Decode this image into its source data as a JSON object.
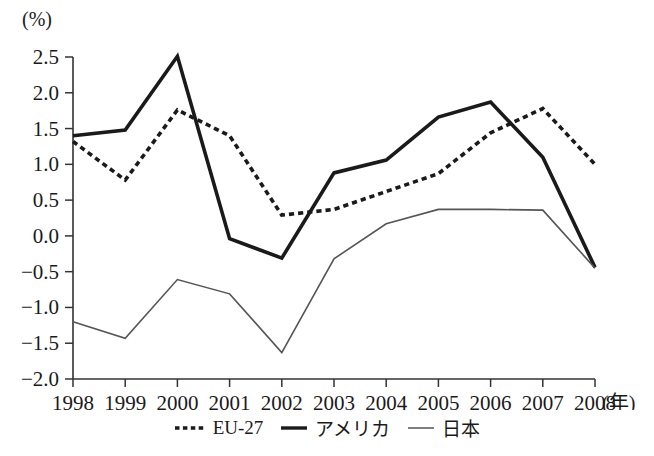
{
  "chart_data": {
    "type": "line",
    "title": "",
    "subtitle": "",
    "unit_label": "(%)",
    "xlabel": "(年)",
    "ylabel": "",
    "x": [
      1998,
      1999,
      2000,
      2001,
      2002,
      2003,
      2004,
      2005,
      2006,
      2007,
      2008
    ],
    "categories": [
      "1998",
      "1999",
      "2000",
      "2001",
      "2002",
      "2003",
      "2004",
      "2005",
      "2006",
      "2007",
      "2008"
    ],
    "xlim": [
      1998,
      2008
    ],
    "ylim": [
      -2.0,
      2.5
    ],
    "ytick_labels": [
      "2.5",
      "2.0",
      "1.5",
      "1.0",
      "0.5",
      "0.0",
      "−0.5",
      "−1.0",
      "−1.5",
      "−2.0"
    ],
    "ytick_values": [
      2.5,
      2.0,
      1.5,
      1.0,
      0.5,
      0.0,
      -0.5,
      -1.0,
      -1.5,
      -2.0
    ],
    "grid": false,
    "legend_position": "bottom",
    "series": [
      {
        "name": "EU-27",
        "style": "dotted",
        "color": "#1a1a1a",
        "values": [
          1.32,
          0.78,
          1.76,
          1.4,
          0.29,
          0.37,
          0.62,
          0.87,
          1.44,
          1.78,
          1.0
        ]
      },
      {
        "name": "アメリカ",
        "style": "thick-solid",
        "color": "#1a1a1a",
        "values": [
          1.4,
          1.48,
          2.51,
          -0.04,
          -0.31,
          0.88,
          1.06,
          1.66,
          1.87,
          1.1,
          -0.44
        ]
      },
      {
        "name": "日本",
        "style": "thin-solid",
        "color": "#555555",
        "values": [
          -1.2,
          -1.43,
          -0.61,
          -0.81,
          -1.63,
          -0.32,
          0.17,
          0.37,
          0.37,
          0.36,
          -0.45
        ]
      }
    ]
  },
  "axis": {
    "x_suffix": "(年)"
  }
}
